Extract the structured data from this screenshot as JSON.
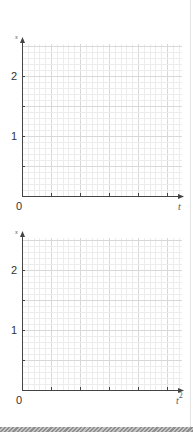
{
  "colors": {
    "axis": "#444444",
    "grid_minor": "#ececec",
    "grid_major": "#d8d8d8",
    "tick_label": "#333333",
    "footer_dark": "#8f8f8f",
    "footer_light": "#c4c4c4"
  },
  "chart_data": [
    {
      "type": "line",
      "title": "",
      "xlabel": "t",
      "ylabel": "s",
      "x_tick_labels": [
        "0"
      ],
      "y_tick_labels": [
        "0",
        "1",
        "2"
      ],
      "y_ticks": [
        0,
        0.5,
        1,
        1.5,
        2
      ],
      "x_major_tick_count": 5,
      "ylim": [
        0,
        2.5
      ],
      "grid": true,
      "grid_minor_subdivisions": 5,
      "series": [],
      "legend": null
    },
    {
      "type": "line",
      "title": "",
      "xlabel": "t²",
      "ylabel": "s",
      "x_tick_labels": [
        "0"
      ],
      "y_tick_labels": [
        "0",
        "1",
        "2"
      ],
      "y_ticks": [
        0,
        0.5,
        1,
        1.5,
        2
      ],
      "x_major_tick_count": 5,
      "ylim": [
        0,
        2.5
      ],
      "grid": true,
      "grid_minor_subdivisions": 5,
      "series": [],
      "legend": null
    }
  ],
  "charts": [
    {
      "id": "s-vs-t",
      "y_axis_label": "s",
      "x_axis_label": "t",
      "x_axis_label_sup": "",
      "origin_label": "0",
      "y_label_1": "1",
      "y_label_2": "2"
    },
    {
      "id": "s-vs-t-squared",
      "y_axis_label": "s",
      "x_axis_label": "t",
      "x_axis_label_sup": "2",
      "origin_label": "0",
      "y_label_1": "1",
      "y_label_2": "2"
    }
  ]
}
